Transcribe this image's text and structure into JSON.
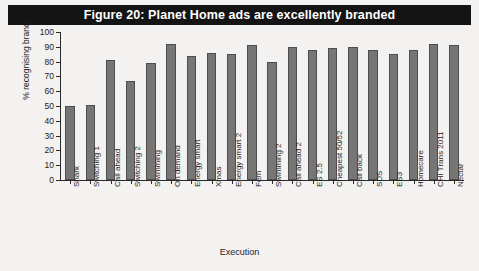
{
  "figure": {
    "title": "Figure 20: Planet Home ads are excellently branded",
    "title_background": "#141414",
    "title_color": "#ffffff",
    "background": "#f4f2f0"
  },
  "chart_data": {
    "type": "bar",
    "title": "Figure 20: Planet Home ads are excellently branded",
    "xlabel": "Execution",
    "ylabel": "% recognising brand",
    "ylim": [
      0,
      100
    ],
    "yticks": [
      0,
      10,
      20,
      30,
      40,
      50,
      60,
      70,
      80,
      90,
      100
    ],
    "grid": false,
    "legend": "none",
    "bar_color": "#777676",
    "bar_edge_color": "#4f4e4e",
    "categories": [
      "Shark",
      "Switching 1",
      "Call ahead",
      "Switching 2",
      "Swimming",
      "On demand",
      "Energy smart",
      "Xmas",
      "Energy smart 2",
      "Fern",
      "Swimming 2",
      "Call ahead 2",
      "ES 2.5",
      "Cheapest 50/52",
      "Call back",
      "SDS",
      "ES3",
      "Homecare",
      "CHI Trans 2011",
      "Nectar"
    ],
    "values": [
      50,
      51,
      81,
      67,
      79,
      92,
      84,
      86,
      85,
      91,
      80,
      90,
      88,
      89,
      90,
      88,
      85,
      88,
      92,
      91
    ]
  }
}
